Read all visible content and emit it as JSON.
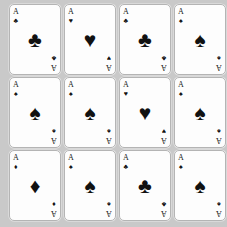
{
  "scene": {
    "description": "Grid of playing cards",
    "background_color": "#c9c9c9",
    "card_face_color": "#fdfdfd",
    "card_border_color": "#b4b4b4",
    "pip_color": "#111111",
    "rows": 3,
    "columns": 4,
    "card_count": 12
  },
  "cards": [
    {
      "rank": "A",
      "suit": "clubs",
      "pip": "♣",
      "label": "Ace of Clubs"
    },
    {
      "rank": "A",
      "suit": "hearts",
      "pip": "♥",
      "label": "Ace of Hearts"
    },
    {
      "rank": "A",
      "suit": "clubs",
      "pip": "♣",
      "label": "Ace of Clubs"
    },
    {
      "rank": "A",
      "suit": "spades",
      "pip": "♠",
      "label": "Ace of Spades"
    },
    {
      "rank": "A",
      "suit": "spades",
      "pip": "♠",
      "label": "Ace of Spades"
    },
    {
      "rank": "A",
      "suit": "spades",
      "pip": "♠",
      "label": "Ace of Spades"
    },
    {
      "rank": "A",
      "suit": "hearts",
      "pip": "♥",
      "label": "Ace of Hearts"
    },
    {
      "rank": "A",
      "suit": "spades",
      "pip": "♠",
      "label": "Ace of Spades"
    },
    {
      "rank": "A",
      "suit": "diamonds",
      "pip": "♦",
      "label": "Ace of Diamonds"
    },
    {
      "rank": "A",
      "suit": "spades",
      "pip": "♠",
      "label": "Ace of Spades"
    },
    {
      "rank": "A",
      "suit": "clubs",
      "pip": "♣",
      "label": "Ace of Clubs"
    },
    {
      "rank": "A",
      "suit": "spades",
      "pip": "♠",
      "label": "Ace of Spades"
    }
  ]
}
